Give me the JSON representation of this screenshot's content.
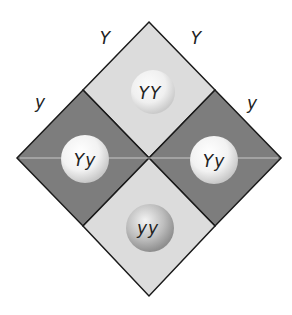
{
  "alleles": {
    "top_left": "Y",
    "top_right": "Y",
    "left": "y",
    "right": "y"
  },
  "cells": [
    {
      "position": "top",
      "genotype": "YY",
      "color": "#dcdcdc"
    },
    {
      "position": "left",
      "genotype": "Yy",
      "color": "#7d7d7d"
    },
    {
      "position": "right",
      "genotype": "Yy",
      "color": "#7d7d7d"
    },
    {
      "position": "bottom",
      "genotype": "yy",
      "color": "#dcdcdc"
    }
  ]
}
